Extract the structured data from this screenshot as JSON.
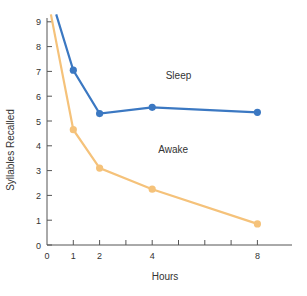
{
  "chart_data": {
    "type": "line",
    "title": "",
    "xlabel": "Hours",
    "ylabel": "Syllables Recalled",
    "xlim": [
      0,
      10
    ],
    "ylim": [
      0,
      9
    ],
    "x_ticks": [
      0,
      1,
      2,
      3,
      4,
      5,
      6,
      7,
      8
    ],
    "x_tick_labels": [
      "0",
      "1",
      "2",
      "",
      "4",
      "",
      "",
      "",
      "8"
    ],
    "y_ticks": [
      0,
      1,
      2,
      3,
      4,
      5,
      6,
      7,
      8,
      9
    ],
    "y_tick_labels": [
      "0",
      "1",
      "2",
      "3",
      "4",
      "5",
      "6",
      "7",
      "8",
      "9"
    ],
    "grid": false,
    "legend": "inline labels",
    "series": [
      {
        "name": "Sleep",
        "color": "#3b78c2",
        "x": [
          1,
          2,
          4,
          8
        ],
        "values": [
          7.05,
          5.3,
          5.55,
          5.35
        ],
        "start": [
          0.35,
          9.3
        ]
      },
      {
        "name": "Awake",
        "color": "#f5c27a",
        "x": [
          1,
          2,
          4,
          8
        ],
        "values": [
          4.65,
          3.1,
          2.25,
          0.85
        ],
        "start": [
          0.15,
          9.3
        ]
      }
    ],
    "annotations": [
      {
        "text": "Sleep",
        "x": 5.0,
        "y": 6.7
      },
      {
        "text": "Awake",
        "x": 4.8,
        "y": 3.7
      }
    ]
  }
}
